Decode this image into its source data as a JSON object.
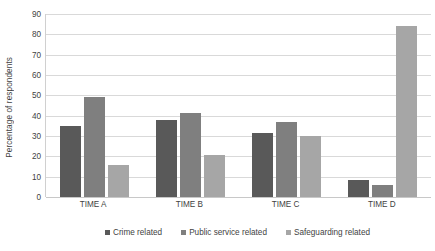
{
  "chart_data": {
    "type": "bar",
    "title": "",
    "xlabel": "",
    "ylabel": "Percentage of respondents",
    "categories": [
      "TIME A",
      "TIME B",
      "TIME C",
      "TIME D"
    ],
    "series": [
      {
        "name": "Crime related",
        "color": "#595959",
        "values": [
          35,
          38,
          31.5,
          8.5
        ]
      },
      {
        "name": "Public service related",
        "color": "#7f7f7f",
        "values": [
          49,
          41.5,
          37,
          6
        ]
      },
      {
        "name": "Safeguarding related",
        "color": "#a6a6a6",
        "values": [
          15.5,
          20.5,
          30,
          84
        ]
      }
    ],
    "ylim": [
      0,
      90
    ],
    "ytick_step": 10,
    "yticks": [
      "0",
      "10",
      "20",
      "30",
      "40",
      "50",
      "60",
      "70",
      "80",
      "90"
    ],
    "grid": true,
    "legend_position": "bottom"
  }
}
